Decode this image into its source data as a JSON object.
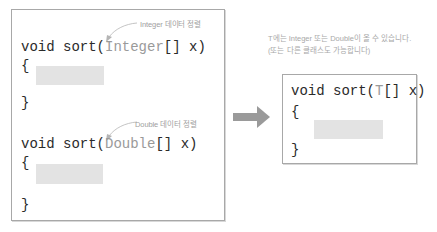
{
  "left_box": {
    "integer_method": {
      "prefix": "void sort(",
      "type": "Integer",
      "suffix": "[] x)",
      "open_brace": "{",
      "close_brace": "}",
      "annotation": "Integer 데이터 정렬"
    },
    "double_method": {
      "prefix": "void sort(",
      "type": "Double",
      "suffix": "[] x)",
      "open_brace": "{",
      "close_brace": "}",
      "annotation": "Double 데이터 정렬"
    }
  },
  "arrow": {
    "icon": "right-arrow-icon",
    "color": "#9a9a9a"
  },
  "right_box": {
    "caption_line1": "T에는 Integer 또는 Double이 올 수 있습니다.",
    "caption_line2": "(또는 다른 클래스도 가능합니다)",
    "generic_method": {
      "prefix": "void sort(",
      "type": "T",
      "suffix": "[] x)",
      "open_brace": "{",
      "close_brace": "}"
    }
  },
  "colors": {
    "border": "#a8a8a8",
    "placeholder_block": "#e3e3e3",
    "type_text": "#9a9a9a",
    "annotation_text": "#a0a0a0"
  }
}
